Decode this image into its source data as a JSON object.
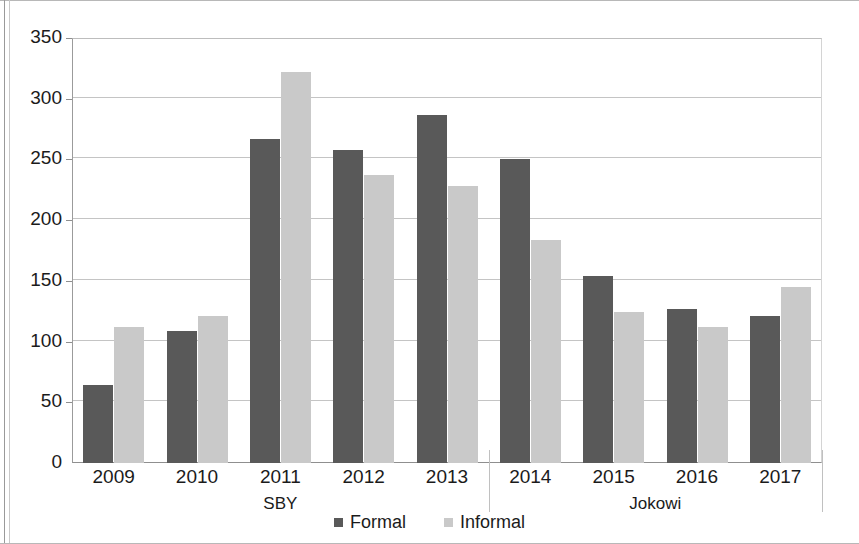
{
  "chart_data": {
    "type": "bar",
    "title": "",
    "subtitle": "",
    "xlabel": "",
    "ylabel": "",
    "categories": [
      "2009",
      "2010",
      "2011",
      "2012",
      "2013",
      "2014",
      "2015",
      "2016",
      "2017"
    ],
    "series": [
      {
        "name": "Formal",
        "color": "#595959",
        "values": [
          64,
          109,
          267,
          258,
          287,
          250,
          154,
          127,
          121
        ]
      },
      {
        "name": "Informal",
        "color": "#c9c9c9",
        "values": [
          112,
          121,
          322,
          237,
          228,
          184,
          124,
          112,
          145
        ]
      }
    ],
    "ylim": [
      0,
      350
    ],
    "y_ticks": [
      0,
      50,
      100,
      150,
      200,
      250,
      300,
      350
    ],
    "y_tick_labels": [
      "0",
      "50",
      "100",
      "150",
      "200",
      "250",
      "300",
      "350"
    ],
    "grid": true,
    "grid_axis": "y",
    "legend_position": "bottom-center",
    "legend_entries": [
      "Formal",
      "Informal"
    ],
    "group_labels": [
      {
        "label": "SBY",
        "categories": [
          "2009",
          "2010",
          "2011",
          "2012",
          "2013"
        ]
      },
      {
        "label": "Jokowi",
        "categories": [
          "2014",
          "2015",
          "2016",
          "2017"
        ]
      }
    ],
    "annotations": []
  },
  "legend": {
    "items": [
      {
        "label": "Formal",
        "color": "#595959"
      },
      {
        "label": "Informal",
        "color": "#c9c9c9"
      }
    ]
  }
}
